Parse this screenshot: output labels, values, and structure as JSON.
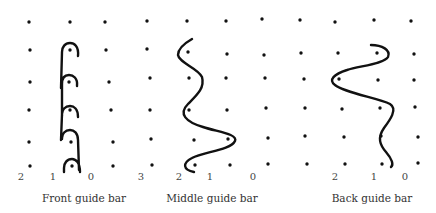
{
  "figure": {
    "colors": {
      "ink": "#111111",
      "label": "#444444",
      "background": "#ffffff"
    },
    "panels": [
      {
        "id": "front",
        "caption": "Front guide bar",
        "caption_pos": [
          84,
          193
        ],
        "needle_labels": [
          {
            "text": "2",
            "x": 21,
            "y": 172
          },
          {
            "text": "1",
            "x": 53,
            "y": 172
          },
          {
            "text": "0",
            "x": 91,
            "y": 172
          }
        ],
        "dots": [
          [
            29,
            22
          ],
          [
            70,
            22
          ],
          [
            105,
            22
          ],
          [
            30,
            50
          ],
          [
            70,
            50
          ],
          [
            106,
            50
          ],
          [
            30,
            82
          ],
          [
            69,
            82
          ],
          [
            109,
            82
          ],
          [
            29,
            110
          ],
          [
            70,
            110
          ],
          [
            111,
            110
          ],
          [
            29,
            142
          ],
          [
            71,
            142
          ],
          [
            113,
            142
          ],
          [
            30,
            166
          ],
          [
            72,
            166
          ],
          [
            113,
            166
          ]
        ],
        "path": "M78,56 C79,46 74,43 70,43 C65,43 62,47 62,52 L61,88 M77,86 C78,78 73,75 69,75 C64,75 62,79 62,84 L62,116 M78,117 C78,109 74,106 70,106 C65,106 62,110 62,114 L61,140 M78,140 C78,133 74,130 70,130 C65,130 62,134 62,138 L62,139 M79,170 L78,140 M80,172 C80,163 76,159 72,159 C67,159 64,163 64,168 L64,172"
      },
      {
        "id": "middle",
        "caption": "Middle guide bar",
        "caption_pos": [
          212,
          193
        ],
        "needle_labels": [
          {
            "text": "3",
            "x": 141,
            "y": 172
          },
          {
            "text": "2",
            "x": 179,
            "y": 172
          },
          {
            "text": "1",
            "x": 210,
            "y": 172
          },
          {
            "text": "0",
            "x": 253,
            "y": 172
          }
        ],
        "dots": [
          [
            147,
            21
          ],
          [
            187,
            21
          ],
          [
            226,
            21
          ],
          [
            262,
            19
          ],
          [
            147,
            49
          ],
          [
            188,
            52
          ],
          [
            227,
            54
          ],
          [
            264,
            55
          ],
          [
            150,
            78
          ],
          [
            189,
            78
          ],
          [
            226,
            78
          ],
          [
            265,
            78
          ],
          [
            150,
            110
          ],
          [
            189,
            110
          ],
          [
            227,
            110
          ],
          [
            266,
            108
          ],
          [
            151,
            139
          ],
          [
            194,
            140
          ],
          [
            228,
            139
          ],
          [
            268,
            138
          ],
          [
            152,
            165
          ],
          [
            195,
            165
          ],
          [
            230,
            165
          ],
          [
            268,
            164
          ]
        ],
        "path": "M192,39 C185,43 178,48 178,55 C179,63 198,68 202,77 C205,88 197,95 188,104 C178,114 186,122 203,127 C218,132 238,134 235,141 C231,150 203,152 192,158 C182,163 183,170 194,172"
      },
      {
        "id": "back",
        "caption": "Back guide bar",
        "caption_pos": [
          372,
          193
        ],
        "needle_labels": [
          {
            "text": "2",
            "x": 335,
            "y": 172
          },
          {
            "text": "1",
            "x": 374,
            "y": 172
          },
          {
            "text": "0",
            "x": 405,
            "y": 172
          }
        ],
        "dots": [
          [
            300,
            20
          ],
          [
            335,
            22
          ],
          [
            374,
            20
          ],
          [
            411,
            21
          ],
          [
            301,
            53
          ],
          [
            338,
            53
          ],
          [
            377,
            53
          ],
          [
            414,
            54
          ],
          [
            304,
            79
          ],
          [
            339,
            79
          ],
          [
            378,
            80
          ],
          [
            414,
            80
          ],
          [
            305,
            108
          ],
          [
            342,
            109
          ],
          [
            380,
            108
          ],
          [
            415,
            107
          ],
          [
            305,
            136
          ],
          [
            344,
            137
          ],
          [
            381,
            136
          ],
          [
            418,
            137
          ],
          [
            307,
            164
          ],
          [
            345,
            164
          ],
          [
            382,
            164
          ],
          [
            418,
            163
          ]
        ],
        "path": "M371,45 C382,45 391,50 388,57 C384,64 359,66 347,70 C334,74 328,80 335,85 C345,93 378,98 390,104 C398,109 390,120 384,128 C377,138 380,145 386,152 C392,159 394,165 391,167"
      }
    ]
  }
}
